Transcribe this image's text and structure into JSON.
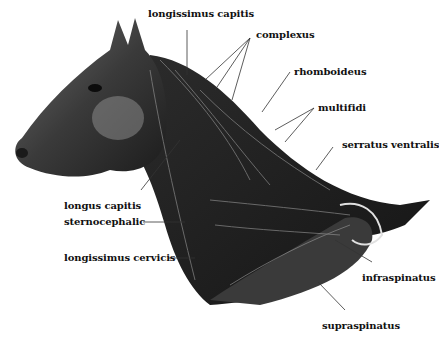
{
  "figure": {
    "colors": {
      "ink": "#111111",
      "shade": "#2a2a2a",
      "background": "#ffffff",
      "leader": "#333333"
    }
  },
  "labels": [
    {
      "id": "longissimus-capitis",
      "text": "longissimus capitis",
      "x": 148,
      "y": 8
    },
    {
      "id": "complexus",
      "text": "complexus",
      "x": 256,
      "y": 29
    },
    {
      "id": "rhomboideus",
      "text": "rhomboideus",
      "x": 294,
      "y": 66
    },
    {
      "id": "multifidi",
      "text": "multifidi",
      "x": 318,
      "y": 102
    },
    {
      "id": "serratus-ventralis",
      "text": "serratus ventralis",
      "x": 342,
      "y": 139
    },
    {
      "id": "longus-capitis",
      "text": "longus capitis",
      "x": 64,
      "y": 200
    },
    {
      "id": "sternocephalic",
      "text": "sternocephalic",
      "x": 64,
      "y": 237
    },
    {
      "id": "longissimus-cervicis",
      "text": "longissimus cervicis",
      "x": 64,
      "y": 253
    },
    {
      "id": "infraspinatus",
      "text": "infraspinatus",
      "x": 362,
      "y": 272
    },
    {
      "id": "supraspinatus",
      "text": "supraspinatus",
      "x": 322,
      "y": 320
    }
  ]
}
